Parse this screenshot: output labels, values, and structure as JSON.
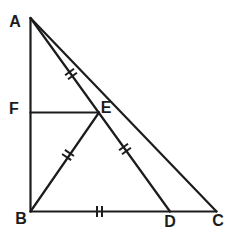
{
  "figure": {
    "background_color": "#ffffff",
    "line_color": "#1c1c1c",
    "line_width": 2.2,
    "tick_line_width": 2,
    "label_color": "#1c1c1c",
    "label_font_size": 16,
    "width": 238,
    "height": 238,
    "points": [
      {
        "name": "A",
        "x": 30.5,
        "y": 18
      },
      {
        "name": "B",
        "x": 30.5,
        "y": 211.5
      },
      {
        "name": "C",
        "x": 216.5,
        "y": 211.5
      },
      {
        "name": "D",
        "x": 170,
        "y": 211.5
      },
      {
        "name": "E",
        "x": 99,
        "y": 112.5
      },
      {
        "name": "F",
        "x": 30.5,
        "y": 112.5
      }
    ],
    "segments": [
      {
        "name": "AB",
        "from": "A",
        "to": "B"
      },
      {
        "name": "BC",
        "from": "B",
        "to": "C"
      },
      {
        "name": "AC",
        "from": "A",
        "to": "C"
      },
      {
        "name": "AD",
        "from": "A",
        "to": "D"
      },
      {
        "name": "BE",
        "from": "B",
        "to": "E"
      },
      {
        "name": "FE",
        "from": "F",
        "to": "E"
      }
    ],
    "ticks": [
      {
        "name": "tick-AE",
        "on_segment": "AE",
        "x": 71,
        "y": 74,
        "segment_angle_deg": 54.2,
        "count": 2
      },
      {
        "name": "tick-BE",
        "on_segment": "BE",
        "x": 68,
        "y": 155,
        "segment_angle_deg": -55.6,
        "count": 2
      },
      {
        "name": "tick-ED",
        "on_segment": "ED",
        "x": 125,
        "y": 149,
        "segment_angle_deg": 54.2,
        "count": 2
      },
      {
        "name": "tick-BD",
        "on_segment": "BD",
        "x": 99.5,
        "y": 211.5,
        "segment_angle_deg": 0,
        "count": 2
      }
    ],
    "tick_style": {
      "length": 11,
      "spacing": 5
    },
    "labels": [
      {
        "name": "A",
        "text": "A",
        "x": 15,
        "y": 21
      },
      {
        "name": "F",
        "text": "F",
        "x": 14,
        "y": 108
      },
      {
        "name": "E",
        "text": "E",
        "x": 106,
        "y": 107
      },
      {
        "name": "B",
        "text": "B",
        "x": 21,
        "y": 218
      },
      {
        "name": "D",
        "text": "D",
        "x": 170,
        "y": 221
      },
      {
        "name": "C",
        "text": "C",
        "x": 218,
        "y": 220
      }
    ]
  }
}
